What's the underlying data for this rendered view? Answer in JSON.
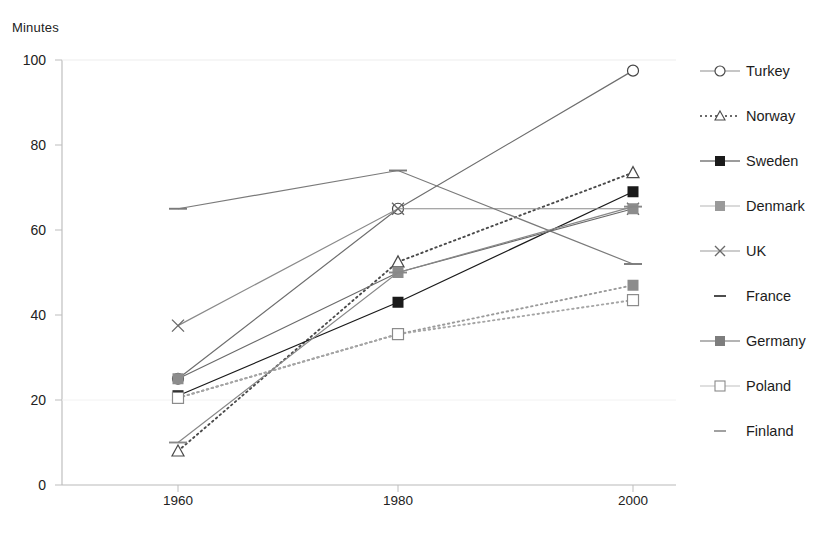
{
  "chart_data": {
    "type": "line",
    "title": "",
    "ylabel": "Minutes",
    "xlabel": "",
    "categories": [
      "1960",
      "1980",
      "2000"
    ],
    "ylim": [
      0,
      100
    ],
    "ytick_labels": [
      "0",
      "20",
      "40",
      "60",
      "80",
      "100"
    ],
    "ytick_values": [
      0,
      20,
      40,
      60,
      80,
      100
    ],
    "grid": false,
    "legend_position": "right",
    "series": [
      {
        "name": "Turkey",
        "values": [
          25,
          65,
          97.5
        ],
        "marker": "open-circle",
        "line": "solid",
        "color": "#6e6e6e"
      },
      {
        "name": "Norway",
        "values": [
          8,
          52.5,
          73.5
        ],
        "marker": "open-triangle",
        "line": "dotted",
        "color": "#4a4a4a"
      },
      {
        "name": "Sweden",
        "values": [
          21,
          43,
          69
        ],
        "marker": "filled-square",
        "line": "solid",
        "color": "#1a1a1a"
      },
      {
        "name": "Denmark",
        "values": [
          20.5,
          35.5,
          47
        ],
        "marker": "grey-square",
        "line": "dotted",
        "color": "#9a9a9a"
      },
      {
        "name": "UK",
        "values": [
          37.5,
          65,
          65
        ],
        "marker": "x-cross",
        "line": "solid",
        "color": "#8a8a8a"
      },
      {
        "name": "France",
        "values": [
          65,
          74,
          52
        ],
        "marker": "dash",
        "line": "solid",
        "color": "#7a7a7a"
      },
      {
        "name": "Germany",
        "values": [
          25,
          50,
          65
        ],
        "marker": "grey-square",
        "line": "solid",
        "color": "#6a6a6a"
      },
      {
        "name": "Poland",
        "values": [
          20.5,
          35.5,
          43.5
        ],
        "marker": "open-square",
        "line": "dotted",
        "color": "#a5a5a5"
      },
      {
        "name": "Finland",
        "values": [
          10,
          50,
          65.5
        ],
        "marker": "dash",
        "line": "solid",
        "color": "#888888"
      }
    ]
  },
  "legend": {
    "items": [
      {
        "label": "Turkey"
      },
      {
        "label": "Norway"
      },
      {
        "label": "Sweden"
      },
      {
        "label": "Denmark"
      },
      {
        "label": "UK"
      },
      {
        "label": "France"
      },
      {
        "label": "Germany"
      },
      {
        "label": "Poland"
      },
      {
        "label": "Finland"
      }
    ]
  }
}
